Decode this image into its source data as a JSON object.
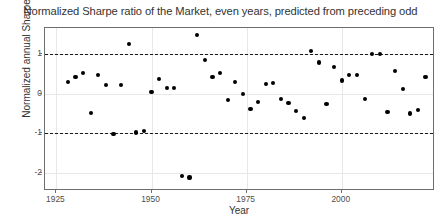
{
  "chart_data": {
    "type": "scatter",
    "title": "Normalized Sharpe ratio of the Market, even years, predicted from preceding odd",
    "xlabel": "Year",
    "ylabel": "Normalized annual Sharpe",
    "xlim": [
      1922.0,
      2024.5
    ],
    "ylim": [
      -2.45,
      1.65
    ],
    "xticks": [
      1925,
      1950,
      1975,
      2000
    ],
    "xtick_labels": [
      "1925",
      "1950",
      "1975",
      "2000"
    ],
    "yticks": [
      1,
      0,
      -1,
      -2
    ],
    "ytick_labels": [
      "1",
      "0",
      "-1",
      "-2"
    ],
    "grid": true,
    "grid_color": "#e8e8e8",
    "legend": "none",
    "point_color": "#000000",
    "reference_lines": [
      {
        "y": 1,
        "style": "dashed",
        "color": "#1a1a1a"
      },
      {
        "y": -1,
        "style": "dashed",
        "color": "#1a1a1a"
      }
    ],
    "x": [
      1928,
      1930,
      1932,
      1934,
      1936,
      1938,
      1940,
      1942,
      1944,
      1946,
      1948,
      1950,
      1952,
      1954,
      1956,
      1958,
      1960,
      1962,
      1964,
      1966,
      1968,
      1970,
      1972,
      1974,
      1976,
      1978,
      1980,
      1982,
      1984,
      1986,
      1988,
      1990,
      1992,
      1994,
      1996,
      1998,
      2000,
      2002,
      2004,
      2006,
      2008,
      2010,
      2012,
      2014,
      2016,
      2018,
      2020,
      2022
    ],
    "y": [
      0.29,
      0.42,
      0.52,
      -0.48,
      0.47,
      0.22,
      -1.01,
      0.21,
      1.24,
      -0.98,
      -0.95,
      0.05,
      0.37,
      0.15,
      0.14,
      -2.08,
      -2.11,
      1.48,
      0.84,
      0.42,
      0.52,
      -0.17,
      0.29,
      -0.02,
      -0.38,
      -0.22,
      0.24,
      0.26,
      -0.13,
      -0.23,
      -0.44,
      -0.62,
      1.08,
      0.78,
      -0.26,
      0.67,
      0.33,
      0.47,
      0.47,
      -0.14,
      0.99,
      1.0,
      -0.47,
      0.57,
      0.11,
      -0.5,
      -0.42,
      0.42
    ],
    "series_name": "normalized annual Sharpe"
  },
  "points": [
    {
      "x": 1928,
      "y": 0.29
    },
    {
      "x": 1930,
      "y": 0.42
    },
    {
      "x": 1932,
      "y": 0.52
    },
    {
      "x": 1934,
      "y": -0.48
    },
    {
      "x": 1936,
      "y": 0.47
    },
    {
      "x": 1938,
      "y": 0.22
    },
    {
      "x": 1940,
      "y": -1.01
    },
    {
      "x": 1942,
      "y": 0.21
    },
    {
      "x": 1944,
      "y": 1.24
    },
    {
      "x": 1946,
      "y": -0.98
    },
    {
      "x": 1948,
      "y": -0.95
    },
    {
      "x": 1950,
      "y": 0.05
    },
    {
      "x": 1952,
      "y": 0.37
    },
    {
      "x": 1954,
      "y": 0.15
    },
    {
      "x": 1956,
      "y": 0.14
    },
    {
      "x": 1958,
      "y": -2.08
    },
    {
      "x": 1960,
      "y": -2.11
    },
    {
      "x": 1962,
      "y": 1.48
    },
    {
      "x": 1964,
      "y": 0.84
    },
    {
      "x": 1966,
      "y": 0.42
    },
    {
      "x": 1968,
      "y": 0.52
    },
    {
      "x": 1970,
      "y": -0.17
    },
    {
      "x": 1972,
      "y": 0.29
    },
    {
      "x": 1974,
      "y": -0.02
    },
    {
      "x": 1976,
      "y": -0.38
    },
    {
      "x": 1978,
      "y": -0.22
    },
    {
      "x": 1980,
      "y": 0.24
    },
    {
      "x": 1982,
      "y": 0.26
    },
    {
      "x": 1984,
      "y": -0.13
    },
    {
      "x": 1986,
      "y": -0.23
    },
    {
      "x": 1988,
      "y": -0.44
    },
    {
      "x": 1990,
      "y": -0.62
    },
    {
      "x": 1992,
      "y": 1.08
    },
    {
      "x": 1994,
      "y": 0.78
    },
    {
      "x": 1996,
      "y": -0.26
    },
    {
      "x": 1998,
      "y": 0.67
    },
    {
      "x": 2000,
      "y": 0.33
    },
    {
      "x": 2002,
      "y": 0.47
    },
    {
      "x": 2004,
      "y": 0.47
    },
    {
      "x": 2006,
      "y": -0.14
    },
    {
      "x": 2008,
      "y": 0.99
    },
    {
      "x": 2010,
      "y": 1.0
    },
    {
      "x": 2012,
      "y": -0.47
    },
    {
      "x": 2014,
      "y": 0.57
    },
    {
      "x": 2016,
      "y": 0.11
    },
    {
      "x": 2018,
      "y": -0.5
    },
    {
      "x": 2020,
      "y": -0.42
    },
    {
      "x": 2022,
      "y": 0.42
    }
  ]
}
